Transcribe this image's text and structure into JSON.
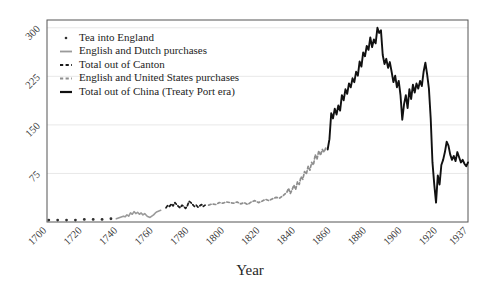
{
  "chart_data": {
    "type": "line",
    "title": "",
    "xlabel": "Year",
    "ylabel": "",
    "xlim": [
      1700,
      1937
    ],
    "ylim": [
      0,
      312
    ],
    "xticks": [
      1700,
      1720,
      1740,
      1760,
      1780,
      1800,
      1820,
      1840,
      1860,
      1880,
      1900,
      1920,
      1937
    ],
    "xtick_labels": [
      "1700",
      "1720",
      "1740",
      "1760",
      "1780",
      "1800",
      "1820",
      "1840",
      "1860",
      "1880",
      "1900",
      "1920",
      "1937"
    ],
    "yticks": [
      75,
      150,
      225,
      300
    ],
    "ytick_labels": [
      "75",
      "150",
      "225",
      "300"
    ],
    "grid": true,
    "grid_axis": "y",
    "legend_position": "upper left",
    "tick_label_rotation": 45,
    "series": [
      {
        "name": "Tea into England",
        "marker": "dot",
        "style": "dots",
        "color": "#303030",
        "points": [
          [
            1701,
            3
          ],
          [
            1706,
            3
          ],
          [
            1711,
            3
          ],
          [
            1716,
            3
          ],
          [
            1721,
            4
          ],
          [
            1726,
            4
          ],
          [
            1731,
            4
          ],
          [
            1736,
            5
          ]
        ]
      },
      {
        "name": "English and Dutch purchases",
        "marker": "line",
        "style": "solid",
        "color": "#9a9a9a",
        "points": [
          [
            1739,
            5
          ],
          [
            1741,
            7
          ],
          [
            1743,
            9
          ],
          [
            1744,
            8
          ],
          [
            1745,
            11
          ],
          [
            1746,
            9
          ],
          [
            1747,
            14
          ],
          [
            1748,
            12
          ],
          [
            1749,
            16
          ],
          [
            1750,
            13
          ],
          [
            1751,
            15
          ],
          [
            1752,
            12
          ],
          [
            1753,
            14
          ],
          [
            1754,
            11
          ],
          [
            1755,
            13
          ],
          [
            1756,
            10
          ],
          [
            1757,
            8
          ],
          [
            1758,
            7
          ],
          [
            1759,
            9
          ],
          [
            1760,
            11
          ],
          [
            1761,
            14
          ],
          [
            1762,
            16
          ],
          [
            1763,
            17
          ],
          [
            1764,
            18
          ]
        ]
      },
      {
        "name": "Total out of Canton",
        "marker": "dashes",
        "style": "dashed",
        "color": "#1a1a1a",
        "points": [
          [
            1767,
            22
          ],
          [
            1768,
            26
          ],
          [
            1769,
            24
          ],
          [
            1770,
            28
          ],
          [
            1771,
            25
          ],
          [
            1772,
            30
          ],
          [
            1773,
            27
          ],
          [
            1774,
            24
          ],
          [
            1775,
            22
          ],
          [
            1776,
            26
          ],
          [
            1777,
            24
          ],
          [
            1778,
            21
          ],
          [
            1779,
            25
          ],
          [
            1780,
            32
          ],
          [
            1781,
            30
          ],
          [
            1782,
            27
          ],
          [
            1783,
            24
          ],
          [
            1784,
            26
          ],
          [
            1785,
            23
          ],
          [
            1786,
            25
          ],
          [
            1787,
            27
          ],
          [
            1788,
            24
          ],
          [
            1789,
            26
          ]
        ]
      },
      {
        "name": "English and United States purchases",
        "marker": "dashes",
        "style": "dashed",
        "color": "#8e8e8e",
        "points": [
          [
            1791,
            26
          ],
          [
            1793,
            28
          ],
          [
            1795,
            27
          ],
          [
            1797,
            30
          ],
          [
            1799,
            29
          ],
          [
            1801,
            31
          ],
          [
            1803,
            30
          ],
          [
            1805,
            29
          ],
          [
            1807,
            31
          ],
          [
            1809,
            28
          ],
          [
            1811,
            30
          ],
          [
            1813,
            27
          ],
          [
            1815,
            31
          ],
          [
            1817,
            33
          ],
          [
            1819,
            30
          ],
          [
            1821,
            32
          ],
          [
            1823,
            35
          ],
          [
            1825,
            33
          ],
          [
            1827,
            36
          ],
          [
            1829,
            38
          ],
          [
            1831,
            37
          ],
          [
            1833,
            41
          ],
          [
            1835,
            46
          ],
          [
            1836,
            52
          ],
          [
            1837,
            44
          ],
          [
            1838,
            50
          ],
          [
            1839,
            57
          ],
          [
            1840,
            50
          ],
          [
            1841,
            62
          ],
          [
            1842,
            58
          ],
          [
            1843,
            70
          ],
          [
            1844,
            66
          ],
          [
            1845,
            78
          ],
          [
            1846,
            74
          ],
          [
            1847,
            86
          ],
          [
            1848,
            80
          ],
          [
            1849,
            92
          ],
          [
            1850,
            88
          ],
          [
            1851,
            104
          ],
          [
            1852,
            97
          ],
          [
            1853,
            110
          ],
          [
            1854,
            103
          ],
          [
            1855,
            112
          ],
          [
            1856,
            108
          ],
          [
            1857,
            115
          ]
        ]
      },
      {
        "name": "Total out of China (Treaty Port era)",
        "marker": "line",
        "style": "solid",
        "color": "#111111",
        "points": [
          [
            1858,
            112
          ],
          [
            1859,
            128
          ],
          [
            1860,
            168
          ],
          [
            1861,
            160
          ],
          [
            1862,
            175
          ],
          [
            1863,
            166
          ],
          [
            1864,
            180
          ],
          [
            1865,
            172
          ],
          [
            1866,
            196
          ],
          [
            1867,
            188
          ],
          [
            1868,
            205
          ],
          [
            1869,
            198
          ],
          [
            1870,
            214
          ],
          [
            1871,
            208
          ],
          [
            1872,
            222
          ],
          [
            1873,
            216
          ],
          [
            1874,
            232
          ],
          [
            1875,
            226
          ],
          [
            1876,
            248
          ],
          [
            1877,
            240
          ],
          [
            1878,
            262
          ],
          [
            1879,
            256
          ],
          [
            1880,
            272
          ],
          [
            1881,
            266
          ],
          [
            1882,
            285
          ],
          [
            1883,
            270
          ],
          [
            1884,
            282
          ],
          [
            1885,
            276
          ],
          [
            1886,
            300
          ],
          [
            1887,
            292
          ],
          [
            1888,
            296
          ],
          [
            1889,
            258
          ],
          [
            1890,
            244
          ],
          [
            1891,
            252
          ],
          [
            1892,
            238
          ],
          [
            1893,
            247
          ],
          [
            1894,
            232
          ],
          [
            1895,
            216
          ],
          [
            1896,
            226
          ],
          [
            1897,
            208
          ],
          [
            1898,
            218
          ],
          [
            1899,
            196
          ],
          [
            1900,
            158
          ],
          [
            1901,
            182
          ],
          [
            1902,
            196
          ],
          [
            1903,
            176
          ],
          [
            1904,
            205
          ],
          [
            1905,
            190
          ],
          [
            1906,
            212
          ],
          [
            1907,
            200
          ],
          [
            1908,
            214
          ],
          [
            1909,
            206
          ],
          [
            1910,
            218
          ],
          [
            1911,
            210
          ],
          [
            1912,
            232
          ],
          [
            1913,
            246
          ],
          [
            1914,
            228
          ],
          [
            1915,
            206
          ],
          [
            1916,
            160
          ],
          [
            1917,
            92
          ],
          [
            1918,
            58
          ],
          [
            1919,
            30
          ],
          [
            1920,
            72
          ],
          [
            1921,
            58
          ],
          [
            1922,
            88
          ],
          [
            1923,
            96
          ],
          [
            1924,
            108
          ],
          [
            1925,
            124
          ],
          [
            1926,
            118
          ],
          [
            1927,
            104
          ],
          [
            1928,
            96
          ],
          [
            1929,
            102
          ],
          [
            1930,
            94
          ],
          [
            1931,
            108
          ],
          [
            1932,
            100
          ],
          [
            1933,
            92
          ],
          [
            1934,
            96
          ],
          [
            1935,
            90
          ],
          [
            1936,
            86
          ],
          [
            1937,
            92
          ]
        ]
      }
    ]
  },
  "legend": {
    "entries": [
      {
        "label": "Tea into England"
      },
      {
        "label": "English and Dutch purchases"
      },
      {
        "label": "Total out of Canton"
      },
      {
        "label": "English and United States purchases"
      },
      {
        "label": "Total out of China (Treaty Port era)"
      }
    ]
  },
  "colors": {
    "background": "#ffffff",
    "frame": "#555555",
    "grid": "#e8e8e8",
    "text": "#262626",
    "series_dark": "#111111",
    "series_gray": "#9a9a9a"
  }
}
